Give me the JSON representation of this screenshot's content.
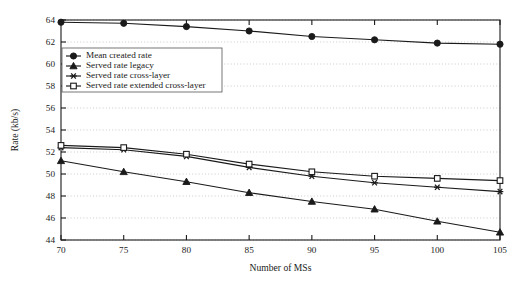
{
  "chart_data": {
    "type": "line",
    "title": "",
    "xlabel": "Number of MSs",
    "ylabel": "Rate (kb/s)",
    "x": [
      70,
      75,
      80,
      85,
      90,
      95,
      100,
      105
    ],
    "xlim": [
      70,
      105
    ],
    "ylim": [
      44,
      64
    ],
    "xticks": [
      "70",
      "75",
      "80",
      "85",
      "90",
      "95",
      "100",
      "105"
    ],
    "yticks": [
      "44",
      "46",
      "48",
      "50",
      "52",
      "54",
      "56",
      "58",
      "60",
      "62",
      "64"
    ],
    "grid": "horizontal-dotted",
    "legend_position": "upper-left-inside",
    "series": [
      {
        "name": "Mean created rate",
        "marker": "circle-filled",
        "values": [
          63.8,
          63.7,
          63.4,
          63.0,
          62.5,
          62.2,
          61.9,
          61.8
        ]
      },
      {
        "name": "Served rate legacy",
        "marker": "triangle-filled",
        "values": [
          51.2,
          50.2,
          49.3,
          48.3,
          47.5,
          46.8,
          45.7,
          44.7
        ]
      },
      {
        "name": "Served rate cross-layer",
        "marker": "asterisk",
        "values": [
          52.4,
          52.2,
          51.6,
          50.6,
          49.8,
          49.2,
          48.8,
          48.4
        ]
      },
      {
        "name": "Served rate extended cross-layer",
        "marker": "square-open",
        "values": [
          52.6,
          52.4,
          51.8,
          50.9,
          50.2,
          49.8,
          49.6,
          49.4
        ]
      }
    ]
  }
}
